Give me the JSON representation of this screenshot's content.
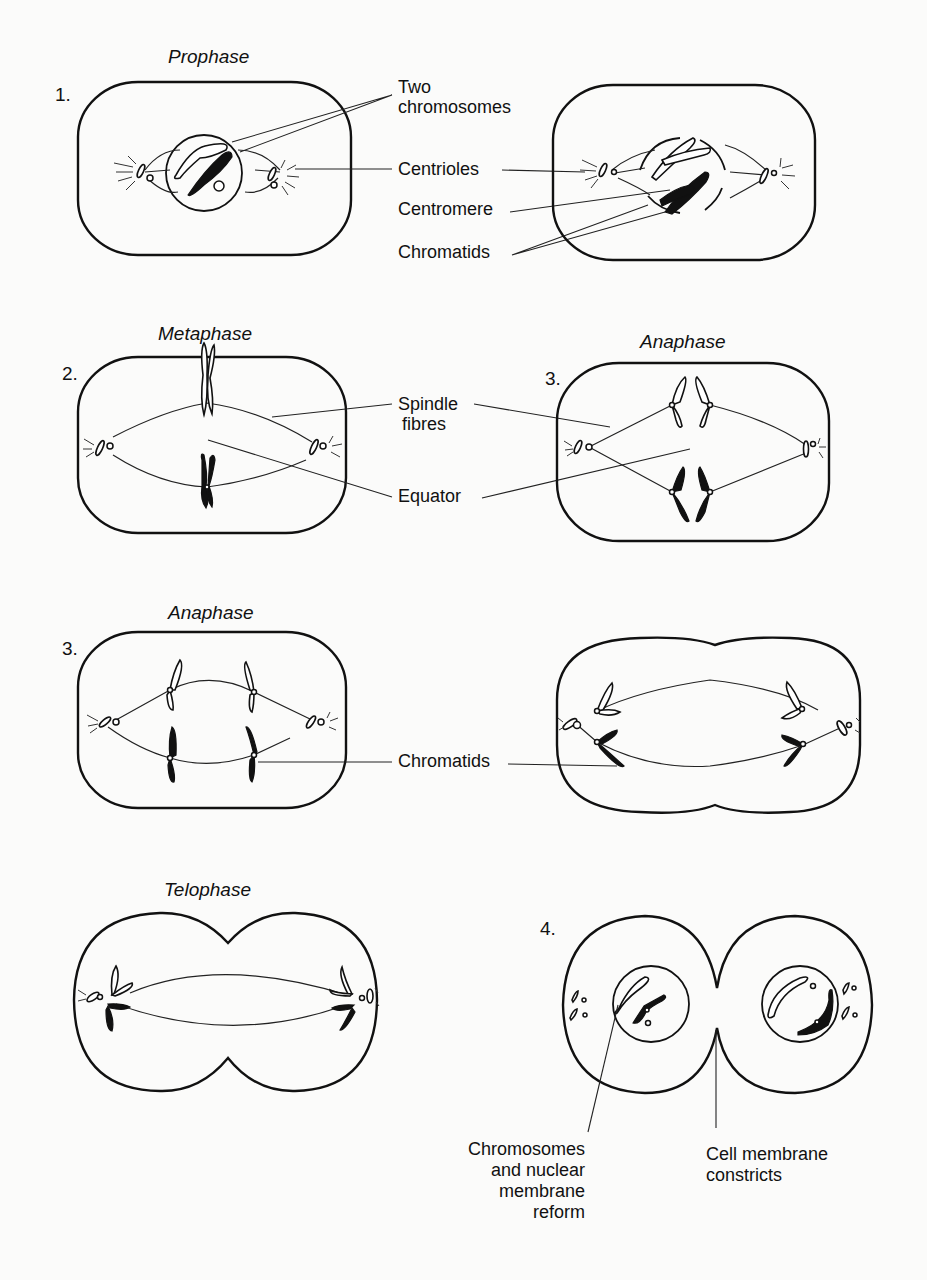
{
  "figure": {
    "panels": [
      {
        "id": "prophase-a",
        "stage_title": "Prophase",
        "number": "1."
      },
      {
        "id": "prophase-b",
        "stage_title": "",
        "number": ""
      },
      {
        "id": "metaphase",
        "stage_title": "Metaphase",
        "number": "2."
      },
      {
        "id": "anaphase-a",
        "stage_title": "Anaphase",
        "number": "3."
      },
      {
        "id": "anaphase-b",
        "stage_title": "Anaphase",
        "number": "3."
      },
      {
        "id": "anaphase-c",
        "stage_title": "",
        "number": ""
      },
      {
        "id": "telophase-a",
        "stage_title": "Telophase",
        "number": ""
      },
      {
        "id": "telophase-b",
        "stage_title": "",
        "number": "4."
      }
    ],
    "labels": {
      "two_chromosomes_1": "Two",
      "two_chromosomes_2": "chromosomes",
      "centrioles": "Centrioles",
      "centromere": "Centromere",
      "chromatids_top": "Chromatids",
      "spindle_1": "Spindle",
      "spindle_2": "fibres",
      "equator": "Equator",
      "chromatids_mid": "Chromatids",
      "reform_1": "Chromosomes",
      "reform_2": "and nuclear",
      "reform_3": "membrane",
      "reform_4": "reform",
      "constrict_1": "Cell membrane",
      "constrict_2": "constricts"
    }
  }
}
